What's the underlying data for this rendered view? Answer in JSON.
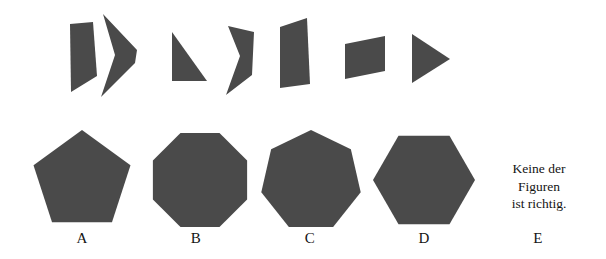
{
  "theme": {
    "background": "#ffffff",
    "shape_fill": "#4a4a4a",
    "text_color": "#141414"
  },
  "task": {
    "type": "figure-assembly-puzzle",
    "piece_count": 7,
    "option_count": 5
  },
  "pieces": {
    "label": "puzzle pieces",
    "items": [
      {
        "name": "piece-1",
        "shape": "quadrilateral",
        "points": "70,24 93,22 97,76 71,92"
      },
      {
        "name": "piece-2",
        "shape": "concave-chevron",
        "points": "103,14 137,50 135,63 101,97 115,55"
      },
      {
        "name": "piece-3",
        "shape": "right-triangle",
        "points": "172,32 172,81 207,81"
      },
      {
        "name": "piece-4",
        "shape": "concave-chevron-small",
        "points": "228,26 254,32 252,75 226,95 240,56"
      },
      {
        "name": "piece-5",
        "shape": "slanted-quadrilateral",
        "points": "280,88 280,27 307,18 310,84"
      },
      {
        "name": "piece-6",
        "shape": "parallelogram",
        "points": "345,44 385,36 385,71 345,79"
      },
      {
        "name": "piece-7",
        "shape": "right-pointing-triangle",
        "points": "412,34 412,83 450,59"
      }
    ]
  },
  "options": {
    "items": [
      {
        "key": "A",
        "label": "A",
        "shape": "pentagon",
        "sides": 5,
        "cx": 82,
        "cy": 181,
        "radius": 51,
        "rotation": 0,
        "label_x": 62,
        "label_y": 230
      },
      {
        "key": "B",
        "label": "B",
        "shape": "octagon",
        "sides": 8,
        "cx": 200,
        "cy": 180,
        "radius": 51,
        "rotation": 22.5,
        "label_x": 176,
        "label_y": 230
      },
      {
        "key": "C",
        "label": "C",
        "shape": "heptagon",
        "sides": 7,
        "cx": 311,
        "cy": 181,
        "radius": 51,
        "rotation": 0,
        "label_x": 290,
        "label_y": 230
      },
      {
        "key": "D",
        "label": "D",
        "shape": "hexagon",
        "sides": 6,
        "cx": 424,
        "cy": 180,
        "radius": 51,
        "rotation": 30,
        "label_x": 404,
        "label_y": 230
      },
      {
        "key": "E",
        "label": "E",
        "shape": "text",
        "label_x": 518,
        "label_y": 230
      }
    ]
  },
  "none_option": {
    "lines": [
      "Keine der",
      "Figuren",
      "ist richtig."
    ],
    "full_text": "Keine der Figuren ist richtig."
  }
}
